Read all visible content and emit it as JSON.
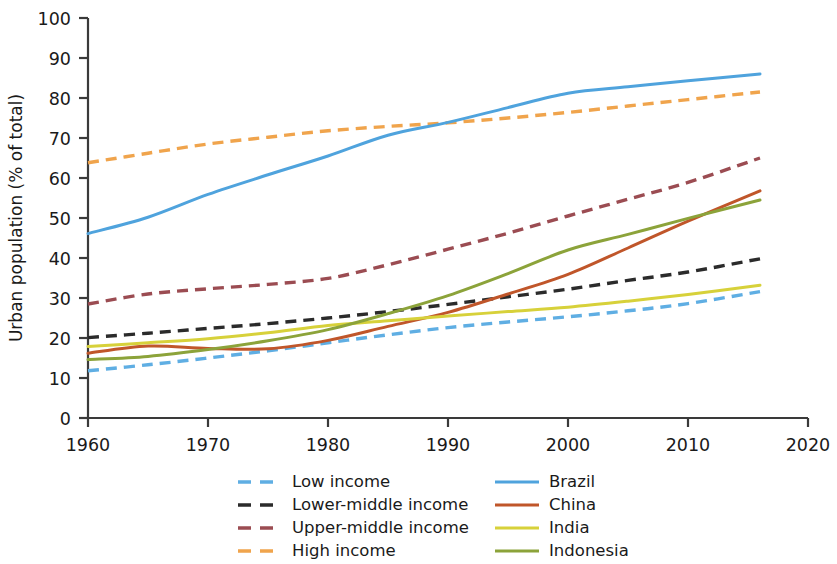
{
  "chart_data": {
    "type": "line",
    "title": "",
    "xlabel": "",
    "ylabel": "Urban population (% of total)",
    "xlim": [
      1960,
      2020
    ],
    "ylim": [
      0,
      100
    ],
    "xticks": [
      1960,
      1970,
      1980,
      1990,
      2000,
      2010,
      2020
    ],
    "yticks": [
      0,
      10,
      20,
      30,
      40,
      50,
      60,
      70,
      80,
      90,
      100
    ],
    "grid": false,
    "legend_position": "below-center",
    "legend_columns": 2,
    "x": [
      1960,
      1965,
      1970,
      1975,
      1980,
      1985,
      1990,
      1995,
      2000,
      2005,
      2010,
      2016
    ],
    "series": [
      {
        "name": "Low income",
        "color": "#5FAEE3",
        "style": "dashed",
        "column": 1,
        "values": [
          11.8,
          13.3,
          15.0,
          16.8,
          18.8,
          20.8,
          22.6,
          24.0,
          25.3,
          26.8,
          28.6,
          31.6
        ]
      },
      {
        "name": "Lower-middle income",
        "color": "#2b2b2b",
        "style": "dashed",
        "column": 1,
        "values": [
          20.1,
          21.2,
          22.4,
          23.6,
          25.0,
          26.6,
          28.4,
          30.3,
          32.2,
          34.4,
          36.5,
          39.8
        ]
      },
      {
        "name": "Upper-middle income",
        "color": "#9B4C52",
        "style": "dashed",
        "column": 1,
        "values": [
          28.5,
          31.0,
          32.3,
          33.4,
          34.9,
          38.3,
          42.2,
          46.2,
          50.5,
          54.7,
          58.9,
          65.0
        ]
      },
      {
        "name": "High income",
        "color": "#F0A44C",
        "style": "dashed",
        "column": 1,
        "values": [
          63.8,
          66.2,
          68.5,
          70.2,
          71.8,
          72.9,
          73.8,
          75.0,
          76.4,
          78.0,
          79.6,
          81.5
        ]
      },
      {
        "name": "Brazil",
        "color": "#4FA3DD",
        "style": "solid",
        "column": 2,
        "values": [
          46.1,
          50.2,
          55.9,
          60.8,
          65.5,
          70.7,
          73.9,
          77.6,
          81.2,
          82.8,
          84.3,
          86.0
        ]
      },
      {
        "name": "China",
        "color": "#C0562A",
        "style": "solid",
        "column": 2,
        "values": [
          16.2,
          18.0,
          17.4,
          17.3,
          19.4,
          22.9,
          26.4,
          31.0,
          35.9,
          42.5,
          49.2,
          56.8
        ]
      },
      {
        "name": "India",
        "color": "#D7D13A",
        "style": "solid",
        "column": 2,
        "values": [
          17.9,
          18.8,
          19.8,
          21.3,
          23.1,
          24.3,
          25.5,
          26.6,
          27.7,
          29.2,
          30.9,
          33.2
        ]
      },
      {
        "name": "Indonesia",
        "color": "#8CA33A",
        "style": "solid",
        "column": 2,
        "values": [
          14.6,
          15.4,
          17.1,
          19.3,
          22.1,
          26.1,
          30.6,
          36.1,
          42.0,
          45.9,
          49.9,
          54.5
        ]
      }
    ]
  },
  "axes": {
    "ylabel": "Urban population (% of total)",
    "xtick_labels": [
      "1960",
      "1970",
      "1980",
      "1990",
      "2000",
      "2010",
      "2020"
    ],
    "ytick_labels": [
      "0",
      "10",
      "20",
      "30",
      "40",
      "50",
      "60",
      "70",
      "80",
      "90",
      "100"
    ]
  },
  "legend": {
    "column1": [
      {
        "label": "Low income",
        "color": "#5FAEE3",
        "style": "dashed"
      },
      {
        "label": "Lower-middle income",
        "color": "#2b2b2b",
        "style": "dashed"
      },
      {
        "label": "Upper-middle income",
        "color": "#9B4C52",
        "style": "dashed"
      },
      {
        "label": "High income",
        "color": "#F0A44C",
        "style": "dashed"
      }
    ],
    "column2": [
      {
        "label": "Brazil",
        "color": "#4FA3DD",
        "style": "solid"
      },
      {
        "label": "China",
        "color": "#C0562A",
        "style": "solid"
      },
      {
        "label": "India",
        "color": "#D7D13A",
        "style": "solid"
      },
      {
        "label": "Indonesia",
        "color": "#8CA33A",
        "style": "solid"
      }
    ]
  }
}
